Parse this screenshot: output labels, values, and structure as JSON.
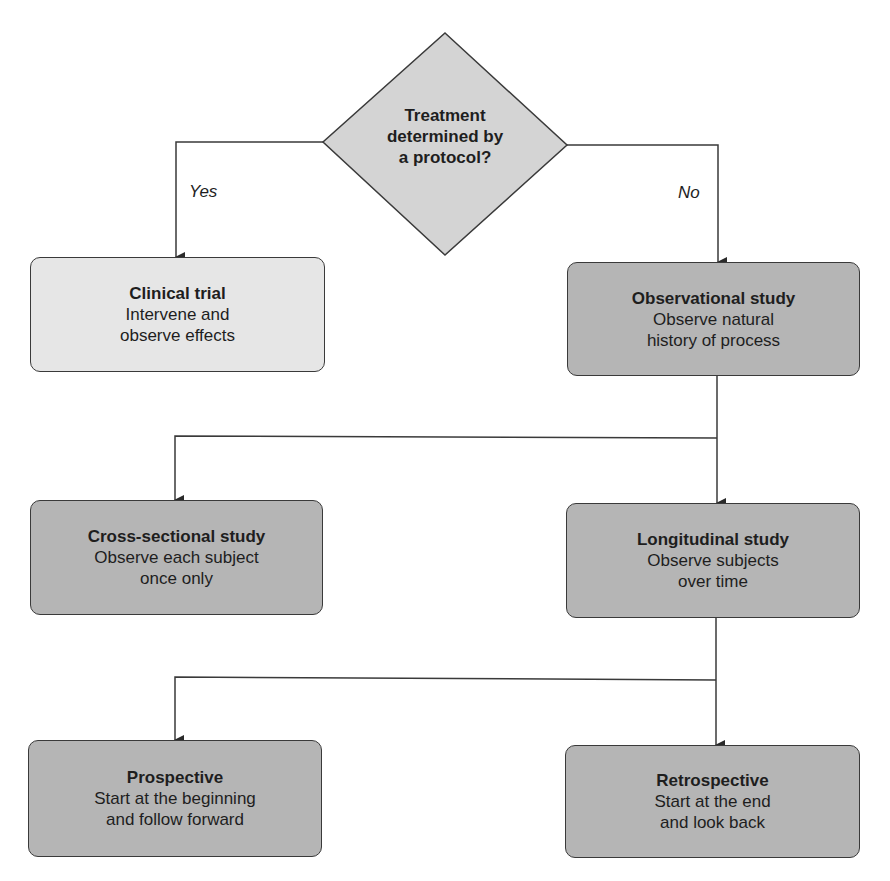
{
  "decision": {
    "question_lines": [
      "Treatment",
      "determined by",
      "a protocol?"
    ],
    "yes_label": "Yes",
    "no_label": "No"
  },
  "nodes": {
    "clinical_trial": {
      "title": "Clinical trial",
      "lines": [
        "Intervene and",
        "observe effects"
      ]
    },
    "observational": {
      "title": "Observational study",
      "lines": [
        "Observe natural",
        "history of process"
      ]
    },
    "cross_sectional": {
      "title": "Cross-sectional study",
      "lines": [
        "Observe each subject",
        "once only"
      ]
    },
    "longitudinal": {
      "title": "Longitudinal study",
      "lines": [
        "Observe subjects",
        "over time"
      ]
    },
    "prospective": {
      "title": "Prospective",
      "lines": [
        "Start at the beginning",
        "and follow forward"
      ]
    },
    "retrospective": {
      "title": "Retrospective",
      "lines": [
        "Start at the end",
        "and look back"
      ]
    }
  },
  "colors": {
    "decision_fill": "#d4d4d4",
    "light_box_fill": "#e6e6e6",
    "dark_box_fill": "#b5b5b5",
    "line": "#3a3a3a"
  }
}
